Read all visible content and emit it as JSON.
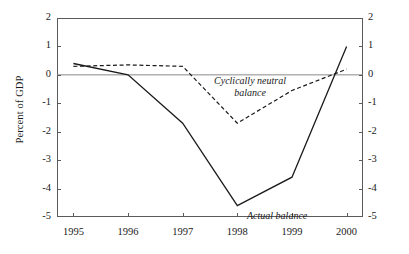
{
  "figure": {
    "title_fragment": "",
    "background_color": "#ffffff",
    "line_color": "#1a1a1a",
    "frame_color": "#5b5b5b",
    "zero_line_color": "#8a8a8a"
  },
  "axes": {
    "ylabel": "Percent of GDP",
    "y_ticks": [
      "2",
      "1",
      "0",
      "-1",
      "-2",
      "-3",
      "-4",
      "-5"
    ],
    "y_ticks_right": [
      "2",
      "1",
      "0",
      "-1",
      "-2",
      "-3",
      "-4",
      "-5"
    ],
    "x_ticks": [
      "1995",
      "1996",
      "1997",
      "1998",
      "1999",
      "2000"
    ]
  },
  "annotations": {
    "cyclically_neutral_line1": "Cyclically neutral",
    "cyclically_neutral_line2": "balance",
    "actual": "Actual balance"
  },
  "chart_data": {
    "type": "line",
    "title": "",
    "xlabel": "",
    "ylabel": "Percent of GDP",
    "x": [
      1995,
      1996,
      1997,
      1998,
      1999,
      2000
    ],
    "xlim": [
      1994.7,
      2000.3
    ],
    "ylim": [
      -5,
      2
    ],
    "grid": false,
    "legend": "inline-annotations",
    "zero_reference_line": 0,
    "series": [
      {
        "name": "Actual balance",
        "style": "solid",
        "values": [
          0.4,
          0.0,
          -1.7,
          -4.6,
          -3.6,
          1.0
        ]
      },
      {
        "name": "Cyclically neutral balance",
        "style": "dashed",
        "values": [
          0.3,
          0.35,
          0.3,
          -1.7,
          -0.55,
          0.2
        ]
      }
    ]
  }
}
